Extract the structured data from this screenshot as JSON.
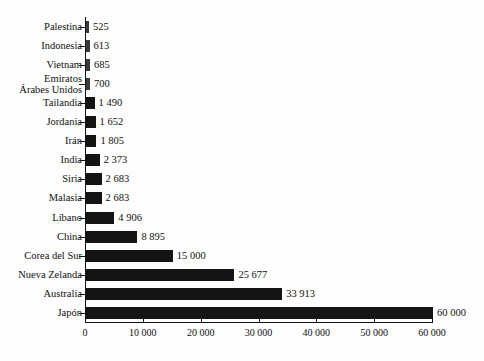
{
  "chart_data": {
    "type": "bar",
    "orientation": "horizontal",
    "title": "",
    "xlabel": "",
    "ylabel": "",
    "xlim": [
      0,
      60000
    ],
    "xticks": [
      0,
      10000,
      20000,
      30000,
      40000,
      50000,
      60000
    ],
    "xtick_labels": [
      "0",
      "10 000",
      "20 000",
      "30 000",
      "40 000",
      "50 000",
      "60 000"
    ],
    "grid": false,
    "legend": "none",
    "bar_color": "#141414",
    "background_color": "#fdfdfd",
    "axis_color": "#111111",
    "categories": [
      "Palestina",
      "Indonesia",
      "Vietnam",
      "Emiratos\nÁrabes Unidos",
      "Tailandia",
      "Jordania",
      "Irán",
      "India",
      "Siria",
      "Malasia",
      "Líbano",
      "China",
      "Corea del Sur",
      "Nueva Zelanda",
      "Australia",
      "Japón"
    ],
    "values": [
      525,
      613,
      685,
      700,
      1490,
      1652,
      1805,
      2373,
      2683,
      2683,
      4906,
      8895,
      15000,
      25677,
      33913,
      60000
    ],
    "value_labels": [
      "525",
      "613",
      "685",
      "700",
      "1 490",
      "1 652",
      "1 805",
      "2 373",
      "2 683",
      "2 683",
      "4 906",
      "8 895",
      "15 000",
      "25 677",
      "33 913",
      "60 000"
    ]
  }
}
